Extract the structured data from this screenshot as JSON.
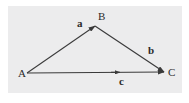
{
  "figure": {
    "background_color": "#ffffff",
    "plot_background_color": "#ececed",
    "stroke_color": "#3a3a3a",
    "text_color": "#2b2b2b"
  },
  "vertices": [
    {
      "id": "A",
      "label": "A",
      "x": 27,
      "y": 73,
      "label_x": 18,
      "label_y": 68
    },
    {
      "id": "B",
      "label": "B",
      "x": 95,
      "y": 26,
      "label_x": 98,
      "label_y": 11
    },
    {
      "id": "C",
      "label": "C",
      "x": 164,
      "y": 72,
      "label_x": 168,
      "label_y": 67
    }
  ],
  "vectors": [
    {
      "id": "a",
      "label": "a",
      "from": "A",
      "to": "B",
      "x1": 27,
      "y1": 73,
      "x2": 95,
      "y2": 26,
      "label_x": 77,
      "label_y": 18,
      "arrow_at_end": true,
      "midpoint_arrow": false
    },
    {
      "id": "b",
      "label": "b",
      "from": "B",
      "to": "C",
      "x1": 95,
      "y1": 26,
      "x2": 164,
      "y2": 72,
      "label_x": 148,
      "label_y": 45,
      "arrow_at_end": true,
      "midpoint_arrow": false
    },
    {
      "id": "c",
      "label": "c",
      "from": "A",
      "to": "C",
      "x1": 27,
      "y1": 73,
      "x2": 164,
      "y2": 72,
      "label_x": 119,
      "label_y": 76,
      "arrow_at_end": true,
      "midpoint_arrow": true,
      "midpoint_arrow_x": 120
    }
  ]
}
